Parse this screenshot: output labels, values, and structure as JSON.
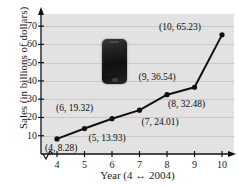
{
  "chart_data": {
    "type": "line",
    "title": "",
    "xlabel": "Year (4 ↔ 2004)",
    "ylabel": "Sales (in billions of dollars)",
    "x": [
      4,
      5,
      6,
      7,
      8,
      9,
      10
    ],
    "values": [
      8.28,
      13.93,
      19.32,
      24.01,
      32.48,
      36.54,
      65.23
    ],
    "point_labels": [
      "(4, 8.28)",
      "(5, 13.93)",
      "(6, 19.32)",
      "(7, 24.01)",
      "(8, 32.48)",
      "(9, 36.54)",
      "(10, 65.23)"
    ],
    "xticks": [
      "4",
      "5",
      "6",
      "7",
      "8",
      "9",
      "10"
    ],
    "yticks": [
      "10",
      "20",
      "30",
      "40",
      "50",
      "60",
      "70"
    ],
    "xlim": [
      4,
      10
    ],
    "ylim": [
      0,
      75
    ],
    "grid": true,
    "legend": "none",
    "x_axis_break": true,
    "marker": "filled-circle",
    "line_color": "#111111",
    "marker_color": "#111111",
    "panel_color": "#e2e2e2",
    "gridline_color": "#c9c9c9"
  },
  "inset": {
    "image_name": "smartphone-photo",
    "description": "dark smartphone"
  }
}
